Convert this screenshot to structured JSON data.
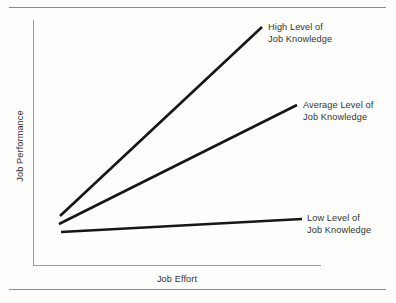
{
  "page": {
    "width": 396,
    "height": 303,
    "background_color": "#fdfdfc",
    "rule_color": "#8a8a8a"
  },
  "chart_data": {
    "type": "line",
    "title": "",
    "subtitle": "",
    "xlabel": "Job Effort",
    "ylabel": "Job Performance",
    "xlim": [
      0,
      1
    ],
    "ylim": [
      0,
      1
    ],
    "grid": false,
    "axis_ticks": false,
    "legend_position": "inline-end-of-line",
    "line_color": "#161616",
    "axis_color": "#9a9a9a",
    "series": [
      {
        "name": "High Level of Job Knowledge",
        "label_line1": "High Level of",
        "label_line2": "Job Knowledge",
        "slope": "steep",
        "x": [
          0.094,
          0.795
        ],
        "y": [
          0.2,
          0.971
        ],
        "pixel_start": [
          60,
          216
        ],
        "pixel_end": [
          262,
          27
        ]
      },
      {
        "name": "Average Level of Job Knowledge",
        "label_line1": "Average Level of",
        "label_line2": "Job Knowledge",
        "slope": "moderate",
        "x": [
          0.09,
          0.917
        ],
        "y": [
          0.167,
          0.652
        ],
        "pixel_start": [
          59,
          224
        ],
        "pixel_end": [
          297,
          105
        ]
      },
      {
        "name": "Low Level of Job Knowledge",
        "label_line1": "Low Level of",
        "label_line2": "Job Knowledge",
        "slope": "near-flat",
        "x": [
          0.097,
          0.934
        ],
        "y": [
          0.134,
          0.187
        ],
        "pixel_start": [
          61,
          232
        ],
        "pixel_end": [
          302,
          219
        ]
      }
    ]
  }
}
